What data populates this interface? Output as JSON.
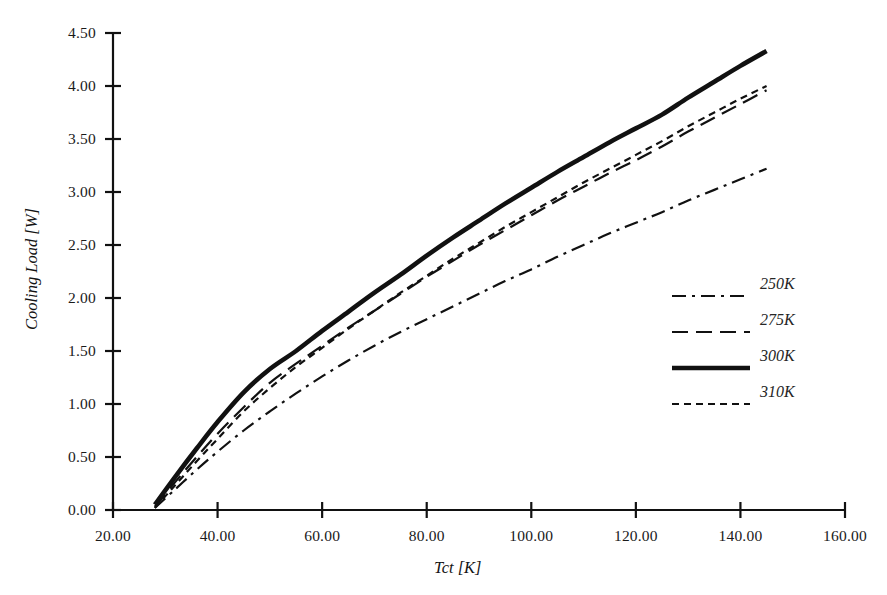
{
  "chart_data": {
    "type": "line",
    "title": "",
    "xlabel": "Tct [K]",
    "ylabel": "Cooling Load [W]",
    "xlim": [
      20,
      160
    ],
    "ylim": [
      0,
      4.5
    ],
    "xticks": [
      "20.00",
      "40.00",
      "60.00",
      "80.00",
      "100.00",
      "120.00",
      "140.00",
      "160.00"
    ],
    "xtick_values": [
      20,
      40,
      60,
      80,
      100,
      120,
      140,
      160
    ],
    "yticks": [
      "0.00",
      "0.50",
      "1.00",
      "1.50",
      "2.00",
      "2.50",
      "3.00",
      "3.50",
      "4.00",
      "4.50"
    ],
    "ytick_values": [
      0,
      0.5,
      1,
      1.5,
      2,
      2.5,
      3,
      3.5,
      4,
      4.5
    ],
    "grid": false,
    "legend_position": "right",
    "line_color": "#111111",
    "series": [
      {
        "name": "250K",
        "dash": "dashdot",
        "stroke_width": 2.2,
        "dasharray": "14,6,3,6",
        "x": [
          28,
          32,
          36,
          40,
          45,
          50,
          55,
          60,
          65,
          70,
          75,
          80,
          85,
          90,
          95,
          100,
          105,
          110,
          115,
          120,
          125,
          130,
          135,
          140,
          145
        ],
        "y": [
          0.02,
          0.2,
          0.38,
          0.55,
          0.75,
          0.93,
          1.1,
          1.26,
          1.41,
          1.55,
          1.68,
          1.8,
          1.92,
          2.04,
          2.16,
          2.27,
          2.39,
          2.5,
          2.61,
          2.71,
          2.81,
          2.92,
          3.02,
          3.12,
          3.22
        ]
      },
      {
        "name": "275K",
        "dash": "longdash",
        "stroke_width": 2.2,
        "dasharray": "16,8",
        "x": [
          28,
          32,
          36,
          40,
          45,
          50,
          55,
          60,
          65,
          70,
          75,
          80,
          85,
          90,
          95,
          100,
          105,
          110,
          115,
          120,
          125,
          130,
          135,
          140,
          145
        ],
        "y": [
          0.03,
          0.27,
          0.5,
          0.72,
          0.97,
          1.2,
          1.38,
          1.55,
          1.72,
          1.88,
          2.04,
          2.2,
          2.35,
          2.5,
          2.64,
          2.78,
          2.92,
          3.05,
          3.18,
          3.3,
          3.43,
          3.57,
          3.7,
          3.83,
          3.96
        ]
      },
      {
        "name": "300K",
        "dash": "solid",
        "stroke_width": 4.6,
        "dasharray": "",
        "x": [
          28,
          32,
          36,
          40,
          45,
          50,
          55,
          60,
          65,
          70,
          75,
          80,
          85,
          90,
          95,
          100,
          105,
          110,
          115,
          120,
          125,
          130,
          135,
          140,
          145
        ],
        "y": [
          0.05,
          0.32,
          0.58,
          0.83,
          1.11,
          1.33,
          1.5,
          1.69,
          1.87,
          2.05,
          2.22,
          2.4,
          2.57,
          2.73,
          2.89,
          3.04,
          3.19,
          3.33,
          3.47,
          3.6,
          3.73,
          3.89,
          4.04,
          4.19,
          4.33
        ]
      },
      {
        "name": "310K",
        "dash": "shortdash",
        "stroke_width": 2.2,
        "dasharray": "7,5",
        "x": [
          28,
          32,
          36,
          40,
          45,
          50,
          55,
          60,
          65,
          70,
          75,
          80,
          85,
          90,
          95,
          100,
          105,
          110,
          115,
          120,
          125,
          130,
          135,
          140,
          145
        ],
        "y": [
          0.02,
          0.24,
          0.46,
          0.67,
          0.93,
          1.15,
          1.35,
          1.53,
          1.71,
          1.88,
          2.05,
          2.21,
          2.37,
          2.52,
          2.67,
          2.81,
          2.95,
          3.09,
          3.22,
          3.35,
          3.48,
          3.62,
          3.75,
          3.88,
          4.0
        ]
      }
    ]
  },
  "legend": {
    "items": [
      {
        "label": "250K"
      },
      {
        "label": "275K"
      },
      {
        "label": "300K"
      },
      {
        "label": "310K"
      }
    ]
  }
}
